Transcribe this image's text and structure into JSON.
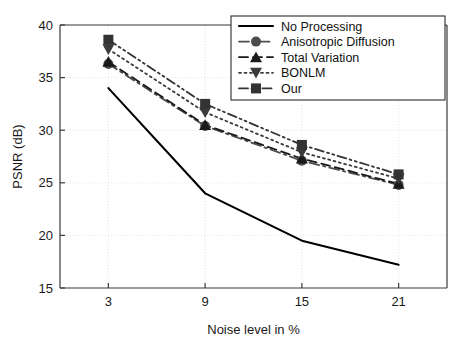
{
  "chart_data": {
    "type": "line",
    "title": "",
    "xlabel": "Noise level in %",
    "ylabel": "PSNR (dB)",
    "x": [
      3,
      9,
      15,
      21
    ],
    "xtick_labels": [
      "3",
      "9",
      "15",
      "21"
    ],
    "ytick_labels": [
      "15",
      "20",
      "25",
      "30",
      "35",
      "40"
    ],
    "yticks": [
      15,
      20,
      25,
      30,
      35,
      40
    ],
    "xlim": [
      0,
      24
    ],
    "ylim": [
      15,
      40
    ],
    "grid": true,
    "legend_position": "top-right",
    "series": [
      {
        "name": "No Processing",
        "values": [
          34.0,
          24.0,
          19.5,
          17.2
        ],
        "color": "#000000",
        "marker": "none",
        "dash": "solid"
      },
      {
        "name": "Anisotropic Diffusion",
        "values": [
          36.3,
          30.4,
          27.1,
          24.8
        ],
        "color": "#4d4d4d",
        "marker": "circle",
        "dash": "dashdot"
      },
      {
        "name": "Total Variation",
        "values": [
          36.5,
          30.5,
          27.3,
          24.9
        ],
        "color": "#1a1a1a",
        "marker": "triangle-up",
        "dash": "dashed"
      },
      {
        "name": "BONLM",
        "values": [
          37.7,
          31.7,
          27.9,
          25.4
        ],
        "color": "#3a3a3a",
        "marker": "triangle-down",
        "dash": "dotted"
      },
      {
        "name": "Our",
        "values": [
          38.6,
          32.5,
          28.6,
          25.8
        ],
        "color": "#333333",
        "marker": "square",
        "dash": "dashdotdot"
      }
    ]
  },
  "legend": {
    "entries": [
      {
        "label": "No Processing"
      },
      {
        "label": "Anisotropic Diffusion"
      },
      {
        "label": "Total Variation"
      },
      {
        "label": "BONLM"
      },
      {
        "label": "Our"
      }
    ]
  },
  "axes": {
    "x_title": "Noise level in %",
    "y_title": "PSNR (dB)",
    "x_ticks": [
      "3",
      "9",
      "15",
      "21"
    ],
    "y_ticks": [
      "15",
      "20",
      "25",
      "30",
      "35",
      "40"
    ]
  }
}
